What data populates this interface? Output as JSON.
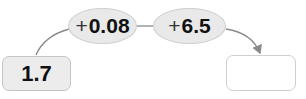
{
  "diagram": {
    "start_value": "1.7",
    "result_value": "",
    "operations": [
      {
        "sign": "+",
        "value": "0.08"
      },
      {
        "sign": "+",
        "value": "6.5"
      }
    ],
    "colors": {
      "box_fill": "#ececec",
      "box_border": "#c4c4c4",
      "oval_fill": "#e9e9e9",
      "connector": "#8a8a8a"
    }
  }
}
